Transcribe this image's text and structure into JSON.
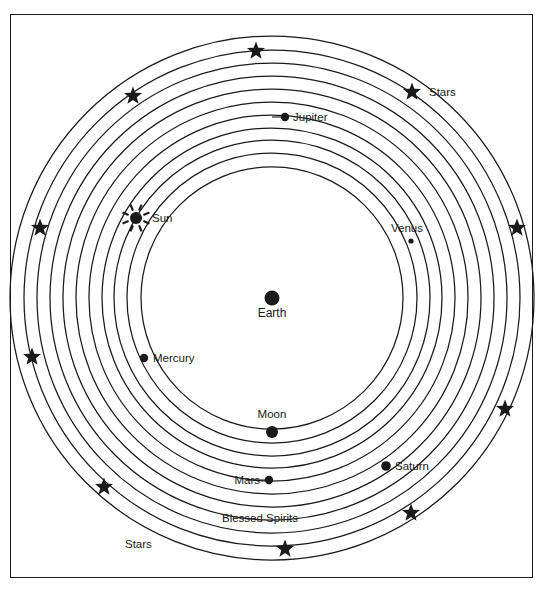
{
  "figure": {
    "background_color": "#ffffff",
    "line_color": "#1a1a1a",
    "frame": {
      "x": 10,
      "y": 14,
      "width": 523,
      "height": 564
    }
  },
  "center": {
    "cx": 272,
    "cy": 298
  },
  "labels": {
    "earth": "Earth",
    "moon": "Moon",
    "mercury": "Mercury",
    "venus": "Venus",
    "sun": "Sun",
    "mars": "Mars",
    "jupiter": "Jupiter",
    "saturn": "Saturn",
    "stars_upper_right": "Stars",
    "stars_lower_left": "Stars",
    "blessed_spirits": "Blessed Spirits"
  },
  "chart_data": {
    "type": "diagram",
    "subtype": "concentric-orbit-cosmology",
    "center_body": "Earth",
    "ring_count": 11,
    "rings": [
      {
        "name": "Moon",
        "radius": 131
      },
      {
        "name": "Mercury",
        "radius": 145
      },
      {
        "name": "Venus",
        "radius": 158
      },
      {
        "name": "Sun",
        "radius": 170
      },
      {
        "name": "Mars",
        "radius": 183
      },
      {
        "name": "Jupiter",
        "radius": 196
      },
      {
        "name": "Saturn",
        "radius": 209
      },
      {
        "name": "Sphere 8",
        "radius": 222
      },
      {
        "name": "Sphere 9",
        "radius": 235
      },
      {
        "name": "Blessed Spirits",
        "radius": 248
      },
      {
        "name": "Stars",
        "radius": 262
      }
    ],
    "bodies": [
      {
        "name": "Earth",
        "x": 272,
        "y": 298,
        "r": 7.5,
        "label_dx": 0,
        "label_dy": 19,
        "label_anchor": "middle"
      },
      {
        "name": "Moon",
        "x": 272,
        "y": 432,
        "r": 6.0,
        "label_dx": 0,
        "label_dy": -14,
        "label_anchor": "middle"
      },
      {
        "name": "Mercury",
        "x": 144,
        "y": 358,
        "r": 4.2,
        "label_dx": 9,
        "label_dy": 4,
        "label_anchor": "start"
      },
      {
        "name": "Venus",
        "x": 411,
        "y": 241,
        "r": 2.6,
        "label_dx": -4,
        "label_dy": -9,
        "label_anchor": "middle"
      },
      {
        "name": "Sun",
        "x": 136,
        "y": 218,
        "r": 6.0,
        "label_dx": 16,
        "label_dy": 4,
        "label_anchor": "start"
      },
      {
        "name": "Mars",
        "x": 269,
        "y": 480,
        "r": 4.2,
        "label_dx": -9,
        "label_dy": 4,
        "label_anchor": "end"
      },
      {
        "name": "Jupiter",
        "x": 285,
        "y": 117,
        "r": 4.2,
        "label_dx": 8,
        "label_dy": 4,
        "label_anchor": "start"
      },
      {
        "name": "Saturn",
        "x": 386,
        "y": 466,
        "r": 4.8,
        "label_dx": 9,
        "label_dy": 4,
        "label_anchor": "start"
      }
    ],
    "stars": [
      {
        "x": 256,
        "y": 51
      },
      {
        "x": 133,
        "y": 96
      },
      {
        "x": 412,
        "y": 92
      },
      {
        "x": 40,
        "y": 228
      },
      {
        "x": 517,
        "y": 228
      },
      {
        "x": 32,
        "y": 357
      },
      {
        "x": 505,
        "y": 409
      },
      {
        "x": 104,
        "y": 487
      },
      {
        "x": 411,
        "y": 513
      },
      {
        "x": 285,
        "y": 549
      }
    ],
    "ring_labels": [
      {
        "text": "Stars",
        "x": 429,
        "y": 96,
        "anchor": "start"
      },
      {
        "text": "Blessed Spirits",
        "x": 222,
        "y": 522,
        "anchor": "start"
      },
      {
        "text": "Stars",
        "x": 125,
        "y": 548,
        "anchor": "start"
      }
    ]
  }
}
